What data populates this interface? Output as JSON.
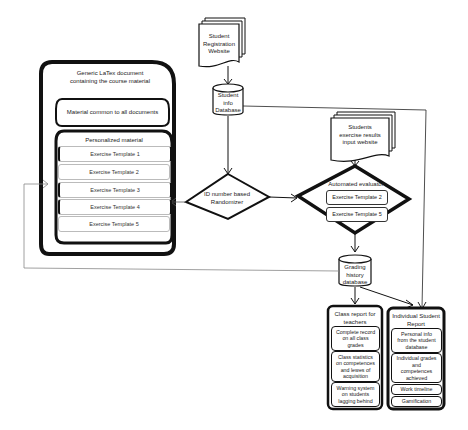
{
  "diagram": {
    "registration_website": {
      "label": "Student\nRegistration\nWebsite"
    },
    "student_info_db": {
      "label": "Student\ninfo\nDatabase"
    },
    "latex_document": {
      "title": "Generic LaTex document\ncontaining the course material",
      "common_material": "Material common to all documents",
      "personalized": {
        "title": "Personalized material",
        "templates": [
          "Exercise Template 1",
          "Exercise Template 2",
          "Exercise Template 3",
          "Exercise Template 4",
          "Exercise Template 5"
        ]
      }
    },
    "randomizer": {
      "label": "ID number based\nRandomizer"
    },
    "results_website": {
      "label": "Students\nexercise results\ninput website"
    },
    "evaluator": {
      "title": "Automated evaluator",
      "templates": [
        "Exercise Template 2",
        "Exercise Template 5"
      ]
    },
    "grading_db": {
      "label": "Grading\nhistory\ndatabase"
    },
    "class_report": {
      "title": "Class report for\nteachers",
      "items": [
        "Complete record\non all class\ngrades",
        "Class statistics\non competences\nand lewes of\nacquisition",
        "Warning system\non students\nlagging behind"
      ]
    },
    "student_report": {
      "title": "Individual Student\nReport",
      "items": [
        "Personal info\nfrom the student\ndatabase",
        "Individual grades\nand\ncompetences\nachieved",
        "Work timeline",
        "Gamification"
      ]
    }
  }
}
